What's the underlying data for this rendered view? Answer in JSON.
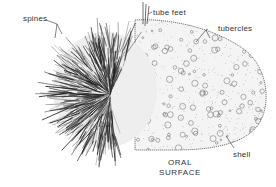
{
  "figure": {
    "colors": {
      "ink": "#222222",
      "label": "#333333",
      "background": "#ffffff"
    },
    "labels": {
      "spines": "spines",
      "tube_feet": "tube feet",
      "tubercles": "tubercles",
      "shell": "shell",
      "oral_surface_line1": "ORAL",
      "oral_surface_line2": "SURFACE"
    }
  }
}
